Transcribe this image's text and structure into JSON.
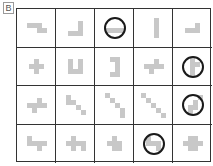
{
  "label": "B",
  "grid": {
    "rows": 4,
    "cols": 5
  },
  "colors": {
    "block": "#c8c8c8",
    "line": "#333333",
    "circle": "#1a1a1a"
  },
  "cells": [
    {
      "r": 0,
      "c": 0,
      "blocks": [
        [
          0,
          0
        ],
        [
          1,
          0
        ],
        [
          2,
          0
        ],
        [
          2,
          1
        ],
        [
          3,
          1
        ]
      ],
      "circled": false
    },
    {
      "r": 0,
      "c": 1,
      "blocks": [
        [
          2,
          0
        ],
        [
          2,
          1
        ],
        [
          0,
          2
        ],
        [
          1,
          2
        ],
        [
          2,
          2
        ]
      ],
      "circled": false
    },
    {
      "r": 0,
      "c": 2,
      "blocks": [
        [
          0,
          1
        ],
        [
          1,
          1
        ],
        [
          2,
          1
        ],
        [
          3,
          1
        ]
      ],
      "circled": true
    },
    {
      "r": 0,
      "c": 3,
      "blocks": [
        [
          1,
          0
        ],
        [
          1,
          1
        ],
        [
          1,
          2
        ],
        [
          1,
          3
        ]
      ],
      "circled": false
    },
    {
      "r": 0,
      "c": 4,
      "blocks": [
        [
          2,
          0
        ],
        [
          0,
          1
        ],
        [
          1,
          1
        ],
        [
          2,
          1
        ]
      ],
      "circled": false
    },
    {
      "r": 1,
      "c": 0,
      "blocks": [
        [
          1,
          0
        ],
        [
          0,
          1
        ],
        [
          1,
          1
        ],
        [
          2,
          1
        ],
        [
          1,
          2
        ]
      ],
      "circled": false
    },
    {
      "r": 1,
      "c": 1,
      "blocks": [
        [
          0,
          0
        ],
        [
          2,
          0
        ],
        [
          0,
          1
        ],
        [
          2,
          1
        ],
        [
          0,
          2
        ],
        [
          1,
          2
        ],
        [
          2,
          2
        ]
      ],
      "circled": false
    },
    {
      "r": 1,
      "c": 2,
      "blocks": [
        [
          0,
          0
        ],
        [
          1,
          0
        ],
        [
          1,
          1
        ],
        [
          1,
          2
        ],
        [
          0,
          3
        ],
        [
          1,
          3
        ]
      ],
      "circled": false
    },
    {
      "r": 1,
      "c": 3,
      "blocks": [
        [
          2,
          0
        ],
        [
          0,
          1
        ],
        [
          1,
          1
        ],
        [
          2,
          1
        ],
        [
          3,
          1
        ],
        [
          1,
          2
        ]
      ],
      "circled": false
    },
    {
      "r": 1,
      "c": 4,
      "blocks": [
        [
          1,
          0
        ],
        [
          1,
          1
        ],
        [
          2,
          1
        ],
        [
          1,
          2
        ],
        [
          1,
          3
        ]
      ],
      "circled": true
    },
    {
      "r": 2,
      "c": 0,
      "blocks": [
        [
          2,
          0
        ],
        [
          0,
          1
        ],
        [
          1,
          1
        ],
        [
          2,
          1
        ],
        [
          3,
          1
        ],
        [
          1,
          2
        ]
      ],
      "circled": false
    },
    {
      "r": 2,
      "c": 1,
      "blocks": [
        [
          0,
          0
        ],
        [
          1,
          1
        ],
        [
          0,
          1
        ],
        [
          2,
          2
        ],
        [
          3,
          3
        ]
      ],
      "circled": false,
      "diag": true
    },
    {
      "r": 2,
      "c": 2,
      "blocks": [
        [
          0,
          0
        ],
        [
          1,
          1
        ],
        [
          2,
          2
        ],
        [
          3,
          3
        ],
        [
          3,
          4
        ]
      ],
      "circled": false
    },
    {
      "r": 2,
      "c": 3,
      "blocks": [
        [
          0,
          0
        ],
        [
          1,
          1
        ],
        [
          2,
          2
        ],
        [
          3,
          3
        ],
        [
          4,
          4
        ]
      ],
      "circled": false
    },
    {
      "r": 2,
      "c": 4,
      "blocks": [
        [
          3,
          0
        ],
        [
          2,
          1
        ],
        [
          2,
          2
        ],
        [
          1,
          2
        ],
        [
          1,
          3
        ]
      ],
      "circled": true
    },
    {
      "r": 3,
      "c": 0,
      "blocks": [
        [
          0,
          0
        ],
        [
          0,
          1
        ],
        [
          1,
          1
        ],
        [
          2,
          1
        ],
        [
          3,
          1
        ],
        [
          2,
          2
        ]
      ],
      "circled": false
    },
    {
      "r": 3,
      "c": 1,
      "blocks": [
        [
          1,
          0
        ],
        [
          0,
          1
        ],
        [
          1,
          1
        ],
        [
          2,
          1
        ],
        [
          3,
          1
        ],
        [
          1,
          2
        ],
        [
          3,
          2
        ]
      ],
      "circled": false
    },
    {
      "r": 3,
      "c": 2,
      "blocks": [
        [
          1,
          0
        ],
        [
          0,
          1
        ],
        [
          1,
          1
        ],
        [
          2,
          1
        ],
        [
          1,
          2
        ],
        [
          2,
          2
        ]
      ],
      "circled": false
    },
    {
      "r": 3,
      "c": 3,
      "blocks": [
        [
          0,
          0
        ],
        [
          0,
          1
        ],
        [
          1,
          1
        ],
        [
          2,
          1
        ],
        [
          2,
          2
        ]
      ],
      "circled": true
    },
    {
      "r": 3,
      "c": 4,
      "blocks": [
        [
          1,
          0
        ],
        [
          2,
          0
        ],
        [
          0,
          1
        ],
        [
          1,
          1
        ],
        [
          2,
          1
        ],
        [
          3,
          1
        ],
        [
          1,
          2
        ],
        [
          2,
          2
        ]
      ],
      "circled": false
    }
  ]
}
